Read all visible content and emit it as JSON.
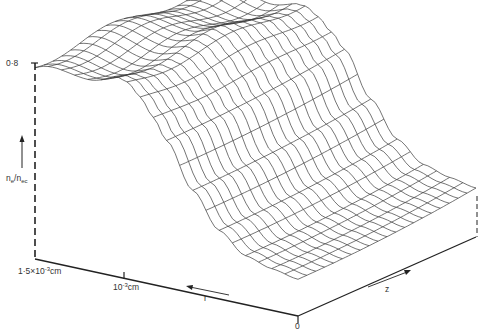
{
  "chart_data": {
    "type": "surface3d",
    "title": "",
    "zlabel": "n_e/n_ec",
    "axes": {
      "vertical": {
        "label": "n_e/n_ec",
        "tick_labels": [
          "0·8"
        ],
        "range": [
          0,
          0.8
        ]
      },
      "r": {
        "label": "r",
        "tick_labels": [
          "1·5×10⁻³cm",
          "10⁻³cm",
          "0"
        ],
        "range_cm": [
          0,
          0.0015
        ]
      },
      "z": {
        "label": "z",
        "tick_labels": [
          "0"
        ]
      }
    },
    "grid": {
      "r_lines": 20,
      "z_lines": 20
    },
    "profile": {
      "description": "Density n_e/n_ec as function of r: plateau near 0.8 for r > ~1e-3 cm, smooth drop toward ~0.15 near r = 0; gentle ripples along z on plateau",
      "r_fraction": [
        0.0,
        0.1,
        0.2,
        0.3,
        0.4,
        0.5,
        0.55,
        0.6,
        0.65,
        0.7,
        0.8,
        0.9,
        1.0
      ],
      "n_over_nec": [
        0.15,
        0.17,
        0.2,
        0.28,
        0.42,
        0.6,
        0.68,
        0.74,
        0.78,
        0.8,
        0.8,
        0.79,
        0.8
      ]
    },
    "line_color": "#3a3a3a",
    "axis_color": "#222222"
  },
  "labels": {
    "peak_value": "0·8",
    "y_axis_name": "n",
    "y_axis_sub1": "e",
    "y_axis_mid": "/n",
    "y_axis_sub2": "ec",
    "r_tick_far_base": "1·5×10",
    "r_tick_far_exp": "-3",
    "r_tick_far_unit": "cm",
    "r_tick_mid_base": "10",
    "r_tick_mid_exp": "-3",
    "r_tick_mid_unit": "cm",
    "origin": "0",
    "r_arrow": "r",
    "z_arrow": "z"
  }
}
